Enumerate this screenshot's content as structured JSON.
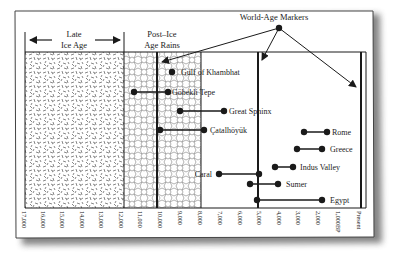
{
  "title": "World-Age Markers",
  "colors": {
    "ink": "#1a1a1a",
    "frame": "#333333",
    "shadow": "#8a8a8a",
    "background": "#ffffff",
    "texture": "#7a7a7a"
  },
  "periods": [
    {
      "label_line1": "Late",
      "label_line2": "Ice Age",
      "from": 17000,
      "to": 12000
    },
    {
      "label_line1": "Post–Ice",
      "label_line2": "Age Rains",
      "from": 12000,
      "to": 8000
    }
  ],
  "axis": {
    "ticks": [
      "17,000",
      "16,000",
      "15,000",
      "14,000",
      "13,000",
      "12,000",
      "11,000",
      "10,000",
      "9,000",
      "8,000",
      "7,000",
      "6,000",
      "5,000",
      "4,000",
      "3,000",
      "2,000",
      "1,000BP",
      "Present"
    ]
  },
  "markers": {
    "label": "World-Age Markers",
    "targets_years_bp": [
      10000,
      5000,
      0
    ]
  },
  "sites": [
    {
      "name": "Gulf of Khambhat",
      "start": 9400,
      "end": 9400
    },
    {
      "name": "Göbekli Tepe",
      "start": 11400,
      "end": 9600
    },
    {
      "name": "Great Sphinx",
      "start": 9000,
      "end": 6800
    },
    {
      "name": "Çatalhöyük",
      "start": 9900,
      "end": 7700
    },
    {
      "name": "Rome",
      "start": 2700,
      "end": 1500
    },
    {
      "name": "Greece",
      "start": 3100,
      "end": 1800
    },
    {
      "name": "Indus Valley",
      "start": 4200,
      "end": 3300
    },
    {
      "name": "Caral",
      "start": 7000,
      "end": 5000
    },
    {
      "name": "Sumer",
      "start": 5500,
      "end": 4100
    },
    {
      "name": "Egypt",
      "start": 5100,
      "end": 1800
    }
  ]
}
